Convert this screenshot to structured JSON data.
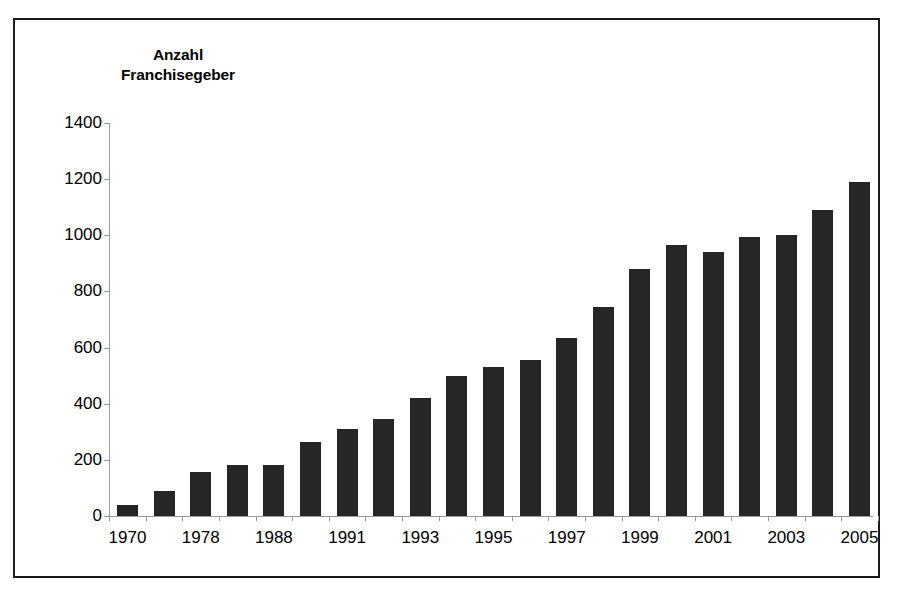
{
  "chart_data": {
    "type": "bar",
    "title_line1": "Anzahl",
    "title_line2": "Franchisegeber",
    "xlabel": "",
    "ylabel": "Anzahl Franchisegeber",
    "ylim": [
      0,
      1400
    ],
    "ytick_step": 200,
    "yticks": [
      0,
      200,
      400,
      600,
      800,
      1000,
      1200,
      1400
    ],
    "ytick_labels": [
      "0",
      "200",
      "400",
      "600",
      "800",
      "1000",
      "1200",
      "1400"
    ],
    "grid": false,
    "legend": "none",
    "bar_color": "#262626",
    "axis_color": "#9a9a9a",
    "frame_color": "#1a1a1a",
    "background": "#ffffff",
    "categories": [
      "1970",
      "1975",
      "1978",
      "1985",
      "1988",
      "1990",
      "1991",
      "1992",
      "1993",
      "1994",
      "1995",
      "1996",
      "1997",
      "1998",
      "1999",
      "2000",
      "2001",
      "2002",
      "2003",
      "2004",
      "2005"
    ],
    "xtick_labels_shown": [
      "1970",
      "1978",
      "1988",
      "1991",
      "1993",
      "1995",
      "1997",
      "1999",
      "2001",
      "2003",
      "2005"
    ],
    "values": [
      40,
      90,
      155,
      180,
      180,
      265,
      310,
      345,
      420,
      500,
      530,
      555,
      635,
      745,
      880,
      965,
      940,
      995,
      1000,
      1090,
      1190
    ]
  }
}
